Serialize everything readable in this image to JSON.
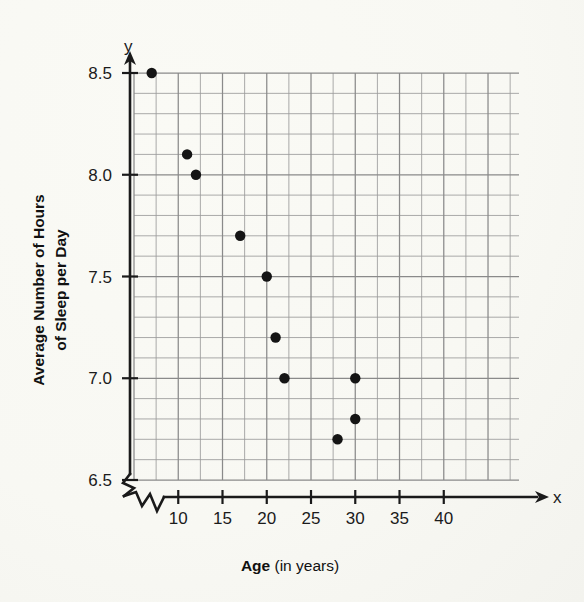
{
  "chart_data": {
    "type": "scatter",
    "title": "",
    "xlabel_bold": "Age",
    "xlabel_rest": " (in years)",
    "xlabel_full": "Age (in years)",
    "ylabel_line1": "Average Number of Hours",
    "ylabel_line2": "of Sleep per Day",
    "ylabel_full": "Average Number of Hours of Sleep per Day",
    "x_axis_letter": "x",
    "y_axis_letter": "y",
    "xlim": [
      5,
      48.5
    ],
    "ylim": [
      6.45,
      8.55
    ],
    "x_tick_labels": [
      "10",
      "15",
      "20",
      "25",
      "30",
      "35",
      "40"
    ],
    "x_tick_values": [
      10,
      15,
      20,
      25,
      30,
      35,
      40
    ],
    "y_tick_labels": [
      "6.5",
      "7.0",
      "7.5",
      "8.0",
      "8.5"
    ],
    "y_tick_values": [
      6.5,
      7.0,
      7.5,
      8.0,
      8.5
    ],
    "grid": true,
    "grid_x_step": 2.5,
    "grid_y_step": 0.1,
    "axis_break_x": true,
    "axis_break_y": true,
    "legend": "none",
    "points": [
      {
        "x": 7,
        "y": 8.5
      },
      {
        "x": 11,
        "y": 8.1
      },
      {
        "x": 12,
        "y": 8.0
      },
      {
        "x": 17,
        "y": 7.7
      },
      {
        "x": 20,
        "y": 7.5
      },
      {
        "x": 21,
        "y": 7.2
      },
      {
        "x": 22,
        "y": 7.0
      },
      {
        "x": 28,
        "y": 6.7
      },
      {
        "x": 30,
        "y": 7.0
      },
      {
        "x": 30,
        "y": 6.8
      }
    ],
    "colors": {
      "point": "#141414",
      "axis": "#1a1a1a",
      "grid_minor": "#9b9b9b",
      "grid_major": "#8a8a8a",
      "background": "#fdfdfb"
    }
  }
}
